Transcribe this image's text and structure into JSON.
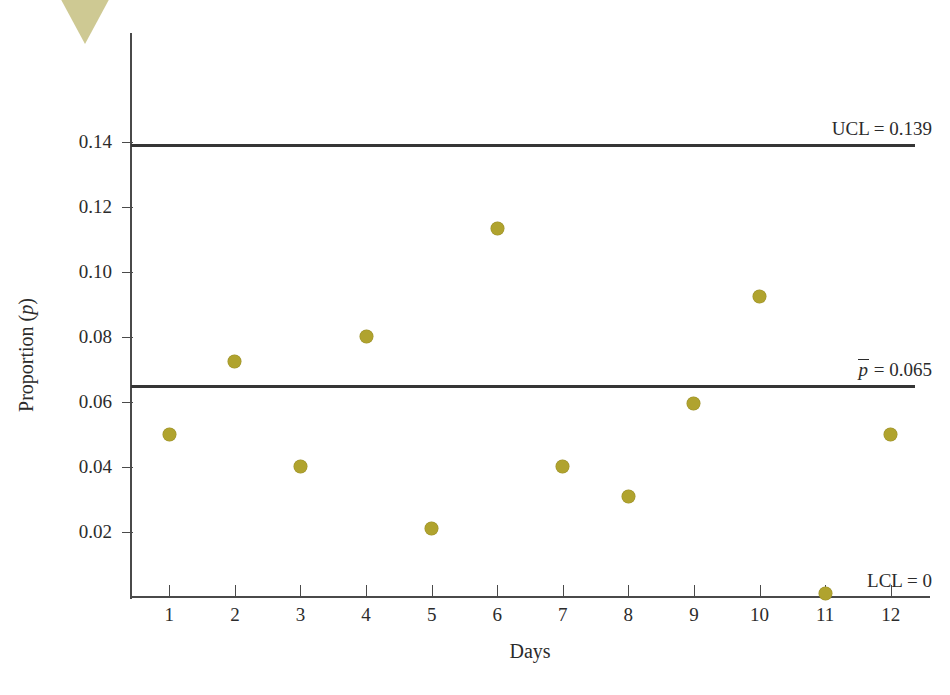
{
  "figure": {
    "decoration": "corner-triangle",
    "decoration_color": "#cec993",
    "marker_color": "#b0a32e",
    "line_color": "#353535"
  },
  "chart_data": {
    "type": "scatter",
    "title": "",
    "xlabel": "Days",
    "ylabel": "Proportion (p)",
    "ylabel_parts": {
      "text": "Proportion (",
      "symbol": "p",
      "close": ")"
    },
    "x": [
      1,
      2,
      3,
      4,
      5,
      6,
      7,
      8,
      9,
      10,
      11,
      12
    ],
    "categories": [
      "1",
      "2",
      "3",
      "4",
      "5",
      "6",
      "7",
      "8",
      "9",
      "10",
      "11",
      "12"
    ],
    "values": [
      0.05,
      0.0725,
      0.04,
      0.08,
      0.021,
      0.1135,
      0.04,
      0.031,
      0.0595,
      0.0925,
      0.001,
      0.05
    ],
    "xlim": [
      0.4,
      12.6
    ],
    "ylim": [
      0.0,
      0.1735
    ],
    "yticks": [
      0.02,
      0.04,
      0.06,
      0.08,
      0.1,
      0.12,
      0.14
    ],
    "ytick_labels": [
      "0.02",
      "0.04",
      "0.06",
      "0.08",
      "0.10",
      "0.12",
      "0.14"
    ],
    "grid": false,
    "legend": "none",
    "control_limits": [
      {
        "name": "UCL",
        "label": "UCL = 0.139",
        "value": 0.139,
        "has_line": true,
        "symbol": "UCL",
        "equals": "=",
        "number": "0.139"
      },
      {
        "name": "CL",
        "label": "p̄ = 0.065",
        "value": 0.065,
        "has_line": true,
        "symbol": "p",
        "equals": "=",
        "number": "0.065"
      },
      {
        "name": "LCL",
        "label": "LCL = 0",
        "value": 0.0,
        "has_line": false,
        "symbol": "LCL",
        "equals": "=",
        "number": "0"
      }
    ]
  }
}
